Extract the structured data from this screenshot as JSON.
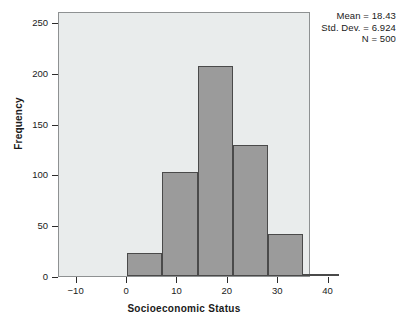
{
  "chart_data": {
    "type": "bar",
    "title": "",
    "xlabel": "Socioeconomic Status",
    "ylabel": "Frequency",
    "xlim": [
      -13.5,
      36.5
    ],
    "ylim": [
      0,
      261
    ],
    "grid": false,
    "legend": "none",
    "bin_width": 7,
    "bin_edges": [
      0,
      7,
      14,
      21,
      28,
      35
    ],
    "categories": [
      "0-7",
      "7-14",
      "14-21",
      "21-28",
      "28-35"
    ],
    "values": [
      23,
      102,
      207,
      129,
      41
    ],
    "bar_color": "#9b9b9b",
    "bar_edge_color": "#4a4a4a",
    "plot_background": "#e9ecec",
    "xticks": [
      {
        "value": -10,
        "label": "-10"
      },
      {
        "value": 0,
        "label": "0"
      },
      {
        "value": 10,
        "label": "10"
      },
      {
        "value": 20,
        "label": "20"
      },
      {
        "value": 30,
        "label": "30"
      },
      {
        "value": 40,
        "label": "40"
      }
    ],
    "yticks": [
      {
        "value": 0,
        "label": "0"
      },
      {
        "value": 50,
        "label": "50"
      },
      {
        "value": 100,
        "label": "100"
      },
      {
        "value": 150,
        "label": "150"
      },
      {
        "value": 200,
        "label": "200"
      },
      {
        "value": 250,
        "label": "250"
      }
    ],
    "annotations": {
      "mean": "Mean = 18.43",
      "std_dev": "Std. Dev. = 6.924",
      "n": "N = 500"
    }
  }
}
